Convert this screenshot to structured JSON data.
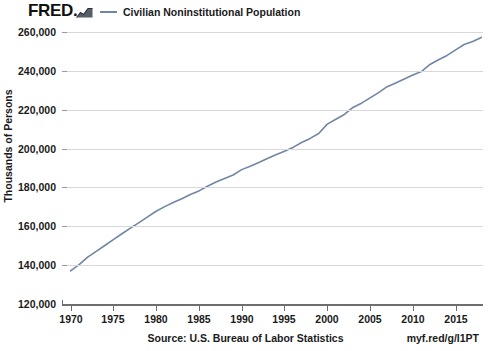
{
  "brand": {
    "logo_text": "FRED.",
    "logo_mark_name": "fred-line-chart-mark"
  },
  "legend": {
    "entries": [
      {
        "label": "Civilian Noninstitutional Population",
        "color": "#7286a3"
      }
    ]
  },
  "footer": {
    "source": "Source: U.S. Bureau of Labor Statistics",
    "short_url": "myf.red/g/l1PT"
  },
  "chart_data": {
    "type": "line",
    "title": "",
    "subtitle": "",
    "xlabel": "",
    "ylabel": "Thousands of Persons",
    "xlim": [
      1969.0,
      2018.2
    ],
    "ylim": [
      120000,
      260000
    ],
    "grid": true,
    "legend_position": "top",
    "xticks": [
      1970,
      1975,
      1980,
      1985,
      1990,
      1995,
      2000,
      2005,
      2010,
      2015
    ],
    "xtick_labels": [
      "1970",
      "1975",
      "1980",
      "1985",
      "1990",
      "1995",
      "2000",
      "2005",
      "2010",
      "2015"
    ],
    "yticks": [
      120000,
      140000,
      160000,
      180000,
      200000,
      220000,
      240000,
      260000
    ],
    "ytick_labels": [
      "120,000",
      "140,000",
      "160,000",
      "180,000",
      "200,000",
      "220,000",
      "240,000",
      "260,000"
    ],
    "series": [
      {
        "name": "Civilian Noninstitutional Population",
        "color": "#7286a3",
        "x": [
          1970,
          1971,
          1972,
          1973,
          1974,
          1975,
          1976,
          1977,
          1978,
          1979,
          1980,
          1981,
          1982,
          1983,
          1984,
          1985,
          1986,
          1987,
          1988,
          1989,
          1990,
          1991,
          1992,
          1993,
          1994,
          1995,
          1996,
          1997,
          1998,
          1999,
          2000,
          2001,
          2002,
          2003,
          2004,
          2005,
          2006,
          2007,
          2008,
          2009,
          2010,
          2011,
          2012,
          2013,
          2014,
          2015,
          2016,
          2017,
          2018
        ],
        "values": [
          137085,
          140216,
          144126,
          147096,
          150120,
          153153,
          156150,
          159033,
          161910,
          164863,
          167745,
          170130,
          172271,
          174215,
          176383,
          178206,
          180587,
          182753,
          184613,
          186393,
          189164,
          190925,
          192805,
          194838,
          196814,
          198584,
          200591,
          203133,
          205220,
          207753,
          212577,
          215092,
          217570,
          221168,
          223357,
          226082,
          228815,
          231867,
          233788,
          235801,
          237830,
          239618,
          243284,
          245679,
          247947,
          250801,
          253538,
          255079,
          257217
        ]
      }
    ],
    "annotations": [
      {
        "x": 2000,
        "note": "census-rebasing-step"
      },
      {
        "x": 2012,
        "note": "census-rebasing-step"
      }
    ]
  }
}
